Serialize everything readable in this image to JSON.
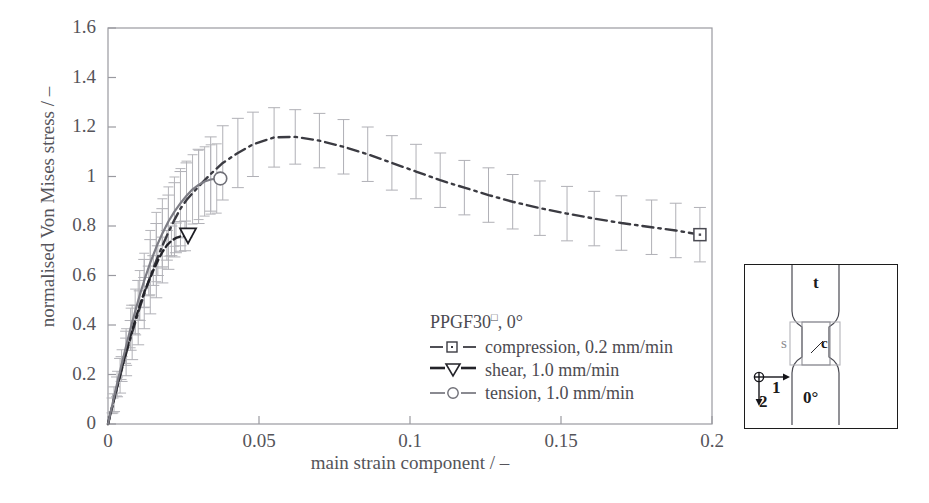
{
  "chart_data": {
    "type": "line",
    "title": "",
    "xlabel": "main strain component / –",
    "ylabel": "normalised Von Mises stress / –",
    "xlim": [
      0,
      0.2
    ],
    "ylim": [
      0,
      1.6
    ],
    "xticks": [
      "0",
      "0.05",
      "0.1",
      "0.15",
      "0.2"
    ],
    "xtick_values": [
      0,
      0.05,
      0.1,
      0.15,
      0.2
    ],
    "yticks": [
      "0",
      "0.2",
      "0.4",
      "0.6",
      "0.8",
      "1",
      "1.2",
      "1.4",
      "1.6"
    ],
    "ytick_values": [
      0,
      0.2,
      0.4,
      0.6,
      0.8,
      1.0,
      1.2,
      1.4,
      1.6
    ],
    "grid": false,
    "legend_position": "center",
    "legend_title": "PPGF30",
    "legend_title_sup": "□",
    "legend_title_suffix": ", 0°",
    "series": [
      {
        "name": "compression, 0.2 mm/min",
        "style": "dash-dot",
        "marker": "square",
        "color": "#3b3b42",
        "x": [
          0.0,
          0.002,
          0.004,
          0.006,
          0.008,
          0.01,
          0.012,
          0.014,
          0.016,
          0.018,
          0.02,
          0.022,
          0.024,
          0.026,
          0.03,
          0.034,
          0.038,
          0.043,
          0.048,
          0.055,
          0.062,
          0.07,
          0.078,
          0.086,
          0.094,
          0.102,
          0.11,
          0.118,
          0.126,
          0.134,
          0.143,
          0.152,
          0.161,
          0.17,
          0.18,
          0.188,
          0.196
        ],
        "y": [
          0.0,
          0.1,
          0.195,
          0.285,
          0.37,
          0.45,
          0.525,
          0.595,
          0.66,
          0.72,
          0.775,
          0.825,
          0.87,
          0.905,
          0.96,
          1.01,
          1.055,
          1.095,
          1.13,
          1.158,
          1.16,
          1.145,
          1.12,
          1.09,
          1.055,
          1.02,
          0.985,
          0.955,
          0.925,
          0.898,
          0.872,
          0.85,
          0.83,
          0.812,
          0.795,
          0.782,
          0.765
        ],
        "err": [
          0.0,
          0.05,
          0.07,
          0.09,
          0.11,
          0.13,
          0.14,
          0.15,
          0.15,
          0.15,
          0.15,
          0.15,
          0.15,
          0.15,
          0.15,
          0.15,
          0.15,
          0.14,
          0.13,
          0.12,
          0.11,
          0.11,
          0.11,
          0.11,
          0.11,
          0.11,
          0.11,
          0.11,
          0.11,
          0.11,
          0.11,
          0.11,
          0.11,
          0.11,
          0.11,
          0.11,
          0.11
        ]
      },
      {
        "name": "shear, 1.0 mm/min",
        "style": "dashed",
        "marker": "triangle-down",
        "color": "#232329",
        "x": [
          0.0,
          0.0015,
          0.003,
          0.0045,
          0.006,
          0.0075,
          0.009,
          0.0105,
          0.012,
          0.0135,
          0.015,
          0.0165,
          0.018,
          0.0195,
          0.021,
          0.0225,
          0.024,
          0.0255
        ],
        "y": [
          0.0,
          0.075,
          0.15,
          0.222,
          0.292,
          0.358,
          0.42,
          0.478,
          0.532,
          0.578,
          0.62,
          0.66,
          0.695,
          0.722,
          0.74,
          0.752,
          0.758,
          0.76
        ],
        "err": [
          0.0,
          0.03,
          0.04,
          0.05,
          0.055,
          0.06,
          0.06,
          0.06,
          0.06,
          0.06,
          0.06,
          0.06,
          0.06,
          0.06,
          0.06,
          0.06,
          0.06,
          0.06
        ],
        "marker_point": [
          0.0265,
          0.762
        ]
      },
      {
        "name": "tension, 1.0 mm/min",
        "style": "solid",
        "marker": "circle",
        "color": "#7d7d85",
        "x": [
          0.0,
          0.0015,
          0.003,
          0.0045,
          0.006,
          0.0075,
          0.009,
          0.0105,
          0.012,
          0.014,
          0.016,
          0.018,
          0.02,
          0.022,
          0.024,
          0.026,
          0.028,
          0.03,
          0.032,
          0.034,
          0.036
        ],
        "y": [
          0.0,
          0.082,
          0.163,
          0.24,
          0.315,
          0.388,
          0.455,
          0.52,
          0.58,
          0.652,
          0.715,
          0.77,
          0.818,
          0.858,
          0.892,
          0.922,
          0.948,
          0.966,
          0.98,
          0.988,
          0.992
        ],
        "err": [
          0.0,
          0.04,
          0.05,
          0.06,
          0.07,
          0.08,
          0.09,
          0.1,
          0.11,
          0.13,
          0.14,
          0.14,
          0.14,
          0.14,
          0.14,
          0.14,
          0.14,
          0.14,
          0.14,
          0.14,
          0.14
        ],
        "marker_point": [
          0.0372,
          0.992
        ]
      }
    ]
  },
  "legend": {
    "rows": [
      {
        "label": "compression, 0.2 mm/min",
        "marker": "square"
      },
      {
        "label": "shear, 1.0 mm/min",
        "marker": "triangle-down"
      },
      {
        "label": "tension, 1.0 mm/min",
        "marker": "circle"
      }
    ]
  },
  "inset": {
    "label_top": "t",
    "label_bottom": "0°",
    "label_shear": "s",
    "label_compression": "c",
    "axis_1": "1",
    "axis_2": "2"
  }
}
